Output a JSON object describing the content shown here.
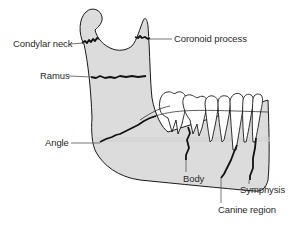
{
  "diagram": {
    "colors": {
      "bone_fill": "#dcdcdc",
      "outline": "#1a1a1a",
      "fracture_line": "#111111",
      "leader_line": "#555555",
      "teeth_fill": "#ffffff",
      "label_text": "#2a2a2a"
    },
    "labels": {
      "condylar_neck": "Condylar neck",
      "coronoid_process": "Coronoid process",
      "ramus": "Ramus",
      "angle": "Angle",
      "body": "Body",
      "symphysis": "Symphysis",
      "canine_region": "Canine region"
    }
  }
}
